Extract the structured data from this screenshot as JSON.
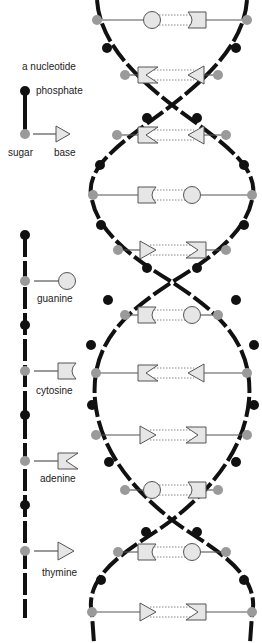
{
  "legend": {
    "nucleotide_title": "a nucleotide",
    "phosphate_label": "phosphate",
    "sugar_label": "sugar",
    "base_label": "base"
  },
  "bases": {
    "guanine": "guanine",
    "cytosine": "cytosine",
    "adenine": "adenine",
    "thymine": "thymine"
  },
  "colors": {
    "phosphate": "#111111",
    "sugar": "#9a9a9a",
    "base_fill": "#e6e6e6",
    "base_stroke": "#555555",
    "backbone": "#111111",
    "hbond": "#888888"
  },
  "helix": {
    "pairs": [
      {
        "y": 20,
        "left": "G",
        "right": "C",
        "lx": 97,
        "rx": 247
      },
      {
        "y": 75,
        "left": "A",
        "right": "T",
        "lx": 125,
        "rx": 218
      },
      {
        "y": 135,
        "left": "A",
        "right": "T",
        "lx": 117,
        "rx": 226
      },
      {
        "y": 195,
        "left": "C",
        "right": "G",
        "lx": 93,
        "rx": 252
      },
      {
        "y": 250,
        "left": "T",
        "right": "A",
        "lx": 118,
        "rx": 226
      },
      {
        "y": 315,
        "left": "C",
        "right": "G",
        "lx": 125,
        "rx": 218
      },
      {
        "y": 373,
        "left": "A",
        "right": "T",
        "lx": 96,
        "rx": 247
      },
      {
        "y": 435,
        "left": "T",
        "right": "A",
        "lx": 96,
        "rx": 247
      },
      {
        "y": 490,
        "left": "G",
        "right": "C",
        "lx": 125,
        "rx": 218
      },
      {
        "y": 552,
        "left": "C",
        "right": "G",
        "lx": 118,
        "rx": 226
      },
      {
        "y": 612,
        "left": "T",
        "right": "A",
        "lx": 92,
        "rx": 252
      }
    ]
  }
}
